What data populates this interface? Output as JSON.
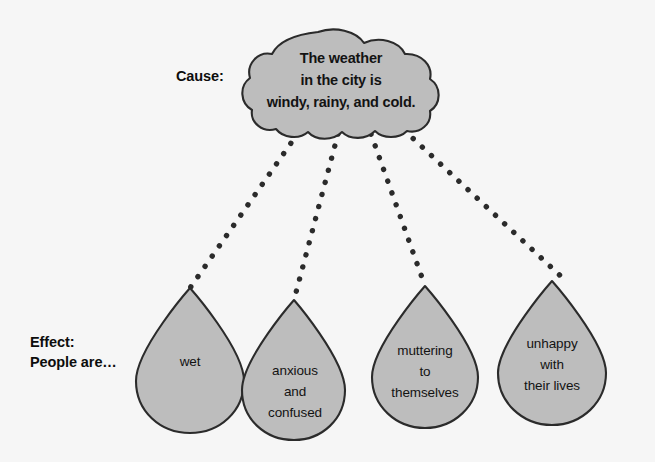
{
  "diagram": {
    "type": "cause-and-effect",
    "background_color": "#f6f6f6",
    "shape_fill_color": "#bdbdbd",
    "shape_stroke_color": "#2b2b2b",
    "rain_dot_color": "#2b2b2b",
    "cause": {
      "label": "Cause:",
      "cloud_text": "The weather\nin the city is\nwindy, rainy, and cold."
    },
    "effect": {
      "label": "Effect:\nPeople are…",
      "droplets": [
        {
          "text": "wet"
        },
        {
          "text": "anxious\nand\nconfused"
        },
        {
          "text": "muttering\nto\nthemselves"
        },
        {
          "text": "unhappy\nwith\ntheir lives"
        }
      ]
    }
  }
}
